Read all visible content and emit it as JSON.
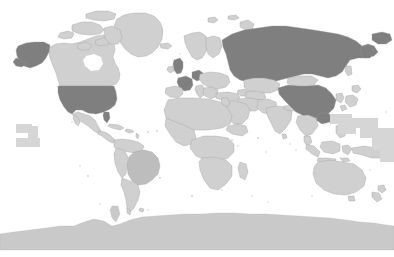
{
  "map": {
    "title": "World map",
    "projection": "equirectangular",
    "background_color": "#ffffff",
    "ocean_color": "#ffffff",
    "legend_visible": false,
    "labels_visible": false,
    "graticule_visible": false,
    "border_color": "#9a9a9a",
    "fill_classes": {
      "highlighted": "#7f7f7f",
      "secondary": "#bdbdbd",
      "base": "#d0d0d0",
      "antarctica": "#c9c9c9"
    },
    "highlighted_regions": [
      "United States of America",
      "Alaska",
      "Russia",
      "China",
      "United Kingdom",
      "France",
      "Germany"
    ],
    "secondary_regions": [
      "Brazil"
    ],
    "base_regions": [
      "Canada",
      "Greenland",
      "Mexico",
      "Central America",
      "Cuba",
      "Caribbean islands",
      "Colombia",
      "Venezuela",
      "Peru",
      "Bolivia",
      "Chile",
      "Argentina",
      "Paraguay",
      "Uruguay",
      "Ecuador",
      "Guyana",
      "Suriname",
      "Norway",
      "Sweden",
      "Finland",
      "Denmark",
      "Ireland",
      "Spain",
      "Portugal",
      "Italy",
      "Poland",
      "Ukraine",
      "Belarus",
      "Romania",
      "Balkans",
      "Greece",
      "Turkey",
      "Iceland",
      "Morocco",
      "Algeria",
      "Tunisia",
      "Libya",
      "Egypt",
      "Sudan",
      "Ethiopia",
      "Kenya",
      "Tanzania",
      "Mali",
      "Niger",
      "Chad",
      "Nigeria",
      "Democratic Republic of the Congo",
      "Angola",
      "Zambia",
      "Namibia",
      "Botswana",
      "South Africa",
      "Madagascar",
      "Saudi Arabia",
      "Iran",
      "Iraq",
      "Kazakhstan",
      "Uzbekistan",
      "Turkmenistan",
      "Afghanistan",
      "Pakistan",
      "India",
      "Nepal",
      "Bangladesh",
      "Myanmar",
      "Thailand",
      "Vietnam",
      "Laos",
      "Cambodia",
      "Malaysia",
      "Indonesia",
      "Philippines",
      "Papua New Guinea",
      "Mongolia",
      "Japan",
      "South Korea",
      "North Korea",
      "Taiwan",
      "Australia",
      "New Zealand",
      "Antarctica"
    ],
    "ocean_markers": [
      "Hawaii-block",
      "Pacific-block-east",
      "Pacific-block-west",
      "Micronesia-block"
    ]
  }
}
